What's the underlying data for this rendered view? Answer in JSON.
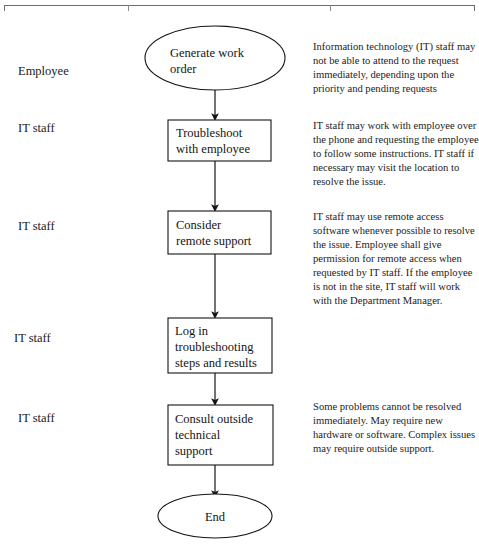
{
  "page": {
    "background_color": "#ffffff",
    "line_color": "#1a1a1a",
    "rule_color": "#6d6d6d"
  },
  "table_rule": {
    "present": true,
    "tick_positions_px": [
      128,
      330
    ]
  },
  "lanes": [
    {
      "role": "Employee"
    },
    {
      "role": "IT staff"
    },
    {
      "role": "IT staff"
    },
    {
      "role": "IT staff"
    },
    {
      "role": "IT staff"
    }
  ],
  "flow": {
    "nodes": [
      {
        "id": "start",
        "shape": "ellipse",
        "label_line1": "Generate work",
        "label_line2": "order",
        "label": "Generate work order"
      },
      {
        "id": "troubleshoot",
        "shape": "rectangle",
        "label_line1": "Troubleshoot",
        "label_line2": "with employee",
        "label": "Troubleshoot with employee"
      },
      {
        "id": "remote-support",
        "shape": "rectangle",
        "label_line1": "Consider",
        "label_line2": "remote support",
        "label": "Consider remote support"
      },
      {
        "id": "log-steps",
        "shape": "rectangle",
        "label_line1": "Log in",
        "label_line2": "troubleshooting",
        "label_line3": "steps and results",
        "label": "Log in troubleshooting steps and results"
      },
      {
        "id": "consult-outside",
        "shape": "rectangle",
        "label_line1": "Consult outside",
        "label_line2": "technical",
        "label_line3": "support",
        "label": "Consult outside technical support"
      },
      {
        "id": "end",
        "shape": "ellipse",
        "label_line1": "End",
        "label": "End"
      }
    ],
    "connectors": [
      {
        "from": "start",
        "to": "troubleshoot",
        "arrow": "down"
      },
      {
        "from": "troubleshoot",
        "to": "remote-support",
        "arrow": "down"
      },
      {
        "from": "remote-support",
        "to": "log-steps",
        "arrow": "down"
      },
      {
        "from": "log-steps",
        "to": "consult-outside",
        "arrow": "down"
      },
      {
        "from": "consult-outside",
        "to": "end",
        "arrow": "down"
      }
    ]
  },
  "notes": [
    {
      "id": "note-generate-work-order",
      "text": "Information technology (IT) staff may not be able to attend to the request immediately, depending upon the priority and pending requests"
    },
    {
      "id": "note-troubleshoot",
      "text": "IT staff may work with employee over the phone and requesting the employee to follow some instructions. IT staff if necessary may visit the location to resolve the issue."
    },
    {
      "id": "note-remote-support",
      "text": "IT staff may use remote access software whenever possible to resolve the issue. Employee shall give permission for remote access when requested by IT staff. If the employee is not in the site, IT staff will work with the Department Manager."
    },
    {
      "id": "note-consult-outside",
      "text": "Some problems cannot be resolved immediately. May require new hardware or software. Complex issues may require outside support."
    }
  ]
}
